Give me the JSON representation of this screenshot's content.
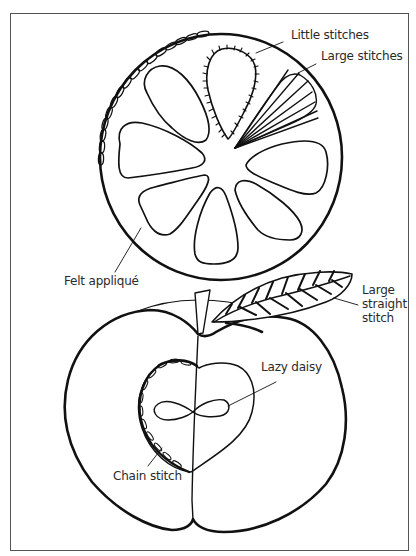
{
  "figure": {
    "colors": {
      "ink": "#111111",
      "border": "#555555",
      "background": "#ffffff",
      "label": "#2a2a2a"
    }
  },
  "orange": {
    "labels": {
      "little_stitches": "Little stitches",
      "large_stitches": "Large stitches",
      "felt_applique": "Felt appliqué"
    }
  },
  "apple": {
    "labels": {
      "large_straight_stitch_1": "Large",
      "large_straight_stitch_2": "straight",
      "large_straight_stitch_3": "stitch",
      "lazy_daisy": "Lazy daisy",
      "chain_stitch": "Chain stitch"
    }
  }
}
